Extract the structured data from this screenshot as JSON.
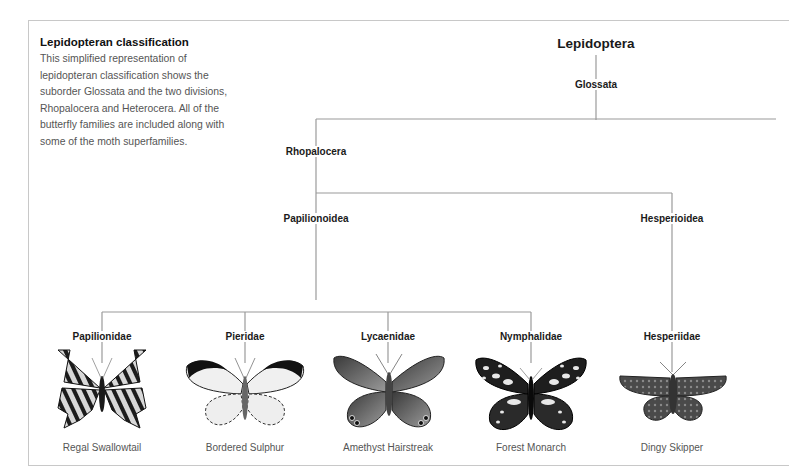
{
  "intro": {
    "title": "Lepidopteran classification",
    "body": "This simplified representation of lepidopteran classification shows the suborder Glossata and the two divisions, Rhopalocera and Heterocera. All of the butterfly families are included along with some of the moth superfamilies."
  },
  "tree": {
    "order": "Lepidoptera",
    "suborder": "Glossata",
    "division": "Rhopalocera",
    "superfamilies": [
      "Papilionoidea",
      "Hesperioidea"
    ],
    "families": [
      {
        "name": "Papilionidae",
        "example": "Regal Swallowtail",
        "icon": "swallowtail-butterfly-icon"
      },
      {
        "name": "Pieridae",
        "example": "Bordered Sulphur",
        "icon": "white-butterfly-icon"
      },
      {
        "name": "Lycaenidae",
        "example": "Amethyst Hairstreak",
        "icon": "hairstreak-butterfly-icon"
      },
      {
        "name": "Nymphalidae",
        "example": "Forest Monarch",
        "icon": "monarch-butterfly-icon"
      },
      {
        "name": "Hesperiidae",
        "example": "Dingy Skipper",
        "icon": "skipper-butterfly-icon"
      }
    ]
  }
}
